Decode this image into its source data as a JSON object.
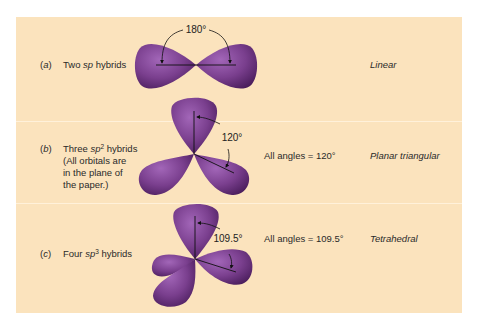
{
  "colors": {
    "panel_background": "#fbe3bd",
    "orbital_mid": "#7a3f8e",
    "orbital_light": "#a266b8",
    "orbital_dark": "#4a1d5c",
    "text": "#2a2a2a"
  },
  "rows": [
    {
      "letter": "a",
      "description_pre": "Two ",
      "description_em": "sp",
      "description_sup": "",
      "description_post": " hybrids",
      "note_lines": [],
      "angle_label": "180°",
      "all_angles": "",
      "geometry": "Linear"
    },
    {
      "letter": "b",
      "description_pre": "Three ",
      "description_em": "sp",
      "description_sup": "2",
      "description_post": " hybrids",
      "note_lines": [
        "(All orbitals are",
        "in the plane of",
        "the paper.)"
      ],
      "angle_label": "120°",
      "all_angles": "All angles = 120°",
      "geometry": "Planar triangular"
    },
    {
      "letter": "c",
      "description_pre": "Four ",
      "description_em": "sp",
      "description_sup": "3",
      "description_post": " hybrids",
      "note_lines": [],
      "angle_label": "109.5°",
      "all_angles": "All angles = 109.5°",
      "geometry": "Tetrahedral"
    }
  ]
}
